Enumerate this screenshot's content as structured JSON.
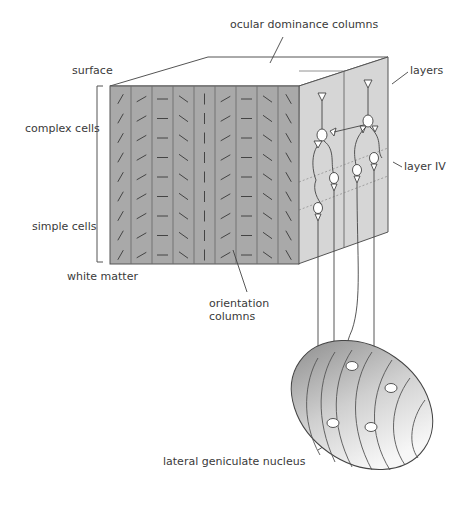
{
  "diagram": {
    "labels": {
      "ocular_dominance": "ocular dominance columns",
      "surface": "surface",
      "layers": "layers",
      "complex_cells": "complex cells",
      "layer_iv": "layer IV",
      "simple_cells": "simple cells",
      "white_matter": "white matter",
      "orientation_line1": "orientation",
      "orientation_line2": "columns",
      "lgn": "lateral geniculate nucleus"
    },
    "orientation_columns": [
      "steep-right",
      "shallow-right",
      "horizontal",
      "shallow-left",
      "vertical",
      "shallow-right",
      "horizontal",
      "shallow-left",
      "steep-left"
    ],
    "colors": {
      "front_face": "#a9a9a9",
      "side_face": "#d6d6d6",
      "top_face": "#ffffff",
      "stroke": "#555555",
      "text": "#3a3a3a"
    }
  }
}
